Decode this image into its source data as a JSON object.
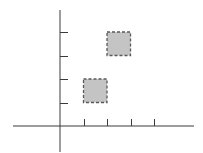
{
  "diagram": {
    "type": "coordinate-grid-with-squares",
    "colors": {
      "background": "#ffffff",
      "axis": "#3a3a3a",
      "square_fill": "#c4c4c4",
      "square_border": "#5a5a5a"
    },
    "origin_px": {
      "x": 60,
      "y": 126
    },
    "unit_px": 23.5,
    "x_axis": {
      "from_px": 13,
      "to_px": 194,
      "ticks": [
        1,
        2,
        3,
        4
      ]
    },
    "y_axis": {
      "from_px": 10,
      "to_px": 152,
      "ticks": [
        1,
        2,
        3,
        4
      ]
    },
    "squares": [
      {
        "name": "lower-square",
        "x": 1,
        "y": 1,
        "size": 1
      },
      {
        "name": "upper-square",
        "x": 2,
        "y": 3,
        "size": 1
      }
    ]
  }
}
